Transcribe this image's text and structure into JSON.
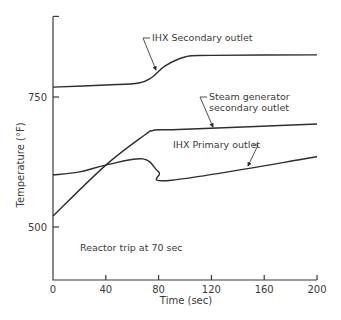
{
  "chart_data": {
    "type": "line",
    "title": "",
    "xlabel": "Time (sec)",
    "ylabel": "Temperature (°F)",
    "xlim": [
      0,
      200
    ],
    "ylim": [
      400,
      905
    ],
    "xticks": [
      0,
      40,
      80,
      120,
      160,
      200
    ],
    "xtick_labels": [
      "0",
      "40",
      "80",
      "120",
      "160",
      "200"
    ],
    "yticks": [
      500,
      750,
      905
    ],
    "ytick_labels": [
      "500",
      "750",
      ""
    ],
    "grid": false,
    "legend": "none (curves labeled by annotations)",
    "series": [
      {
        "name": "IHX Secondary outlet",
        "x": [
          0,
          40,
          65,
          75,
          85,
          100,
          120,
          200
        ],
        "y": [
          769,
          773,
          777,
          788,
          810,
          827,
          830,
          831
        ]
      },
      {
        "name": "Steam generator secondary outlet",
        "x": [
          0,
          40,
          70,
          75,
          80,
          100,
          200
        ],
        "y": [
          521,
          619,
          678,
          685,
          687,
          688,
          698
        ]
      },
      {
        "name": "IHX Primary outlet",
        "x": [
          0,
          20,
          40,
          68,
          80,
          90,
          200
        ],
        "y": [
          600,
          606,
          619,
          631,
          606,
          590,
          635
        ]
      }
    ],
    "annotations": [
      {
        "text": "IHX  Secondary outlet",
        "points_to": "IHX Secondary outlet"
      },
      {
        "text": "Steam generator",
        "points_to": "Steam generator secondary outlet"
      },
      {
        "text": "secondary outlet",
        "points_to": "Steam generator secondary outlet"
      },
      {
        "text": "IHX  Primary  outlet",
        "points_to": "IHX Primary outlet"
      },
      {
        "text": "Reactor trip at 70 sec",
        "points_to": null
      }
    ]
  }
}
